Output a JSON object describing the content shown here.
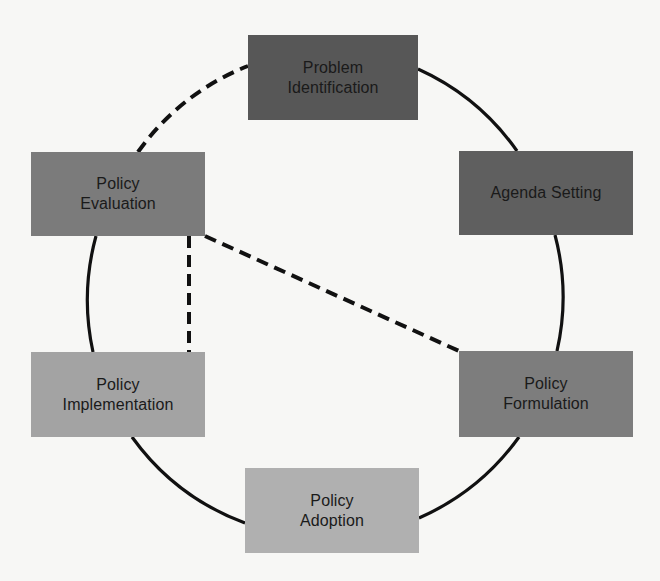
{
  "diagram": {
    "type": "cycle",
    "colors": {
      "background": "#f7f7f5",
      "line": "#111111",
      "text": "#1a1a1a"
    },
    "nodes": [
      {
        "id": "problem-identification",
        "label": "Problem\nIdentification",
        "color": "#575757",
        "x": 248,
        "y": 35,
        "w": 170,
        "h": 85
      },
      {
        "id": "agenda-setting",
        "label": "Agenda Setting",
        "color": "#5f5f5f",
        "x": 459,
        "y": 151,
        "w": 174,
        "h": 84
      },
      {
        "id": "policy-formulation",
        "label": "Policy\nFormulation",
        "color": "#7d7d7d",
        "x": 459,
        "y": 351,
        "w": 174,
        "h": 86
      },
      {
        "id": "policy-adoption",
        "label": "Policy\nAdoption",
        "color": "#b0b0b0",
        "x": 245,
        "y": 468,
        "w": 174,
        "h": 85
      },
      {
        "id": "policy-implementation",
        "label": "Policy\nImplementation",
        "color": "#a3a3a3",
        "x": 31,
        "y": 352,
        "w": 174,
        "h": 85
      },
      {
        "id": "policy-evaluation",
        "label": "Policy\nEvaluation",
        "color": "#7b7b7b",
        "x": 31,
        "y": 152,
        "w": 174,
        "h": 84
      }
    ],
    "edges": [
      {
        "from": "problem-identification",
        "to": "agenda-setting",
        "style": "solid"
      },
      {
        "from": "agenda-setting",
        "to": "policy-formulation",
        "style": "solid"
      },
      {
        "from": "policy-formulation",
        "to": "policy-adoption",
        "style": "solid"
      },
      {
        "from": "policy-adoption",
        "to": "policy-implementation",
        "style": "solid"
      },
      {
        "from": "policy-implementation",
        "to": "policy-evaluation",
        "style": "solid"
      },
      {
        "from": "policy-evaluation",
        "to": "problem-identification",
        "style": "dashed"
      },
      {
        "from": "policy-evaluation",
        "to": "policy-implementation",
        "style": "dashed"
      },
      {
        "from": "policy-evaluation",
        "to": "policy-formulation",
        "style": "dashed"
      }
    ]
  }
}
